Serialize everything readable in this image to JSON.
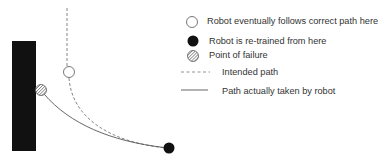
{
  "diagram": {
    "wall": {
      "x": 12,
      "y": 41,
      "w": 24,
      "h": 110,
      "color": "#111111"
    },
    "intended_path": {
      "style": "dashed",
      "color": "#555555",
      "d": "M67 8 L67 66 M69 78 C72 118 110 142 166 148"
    },
    "actual_path": {
      "style": "solid",
      "color": "#444444",
      "d": "M43 94 C70 125 110 140 166 148"
    },
    "markers": {
      "correct_path_point": {
        "cx": 69,
        "cy": 72,
        "r": 5.5,
        "fill": "#ffffff"
      },
      "failure_point": {
        "cx": 41,
        "cy": 90,
        "r": 5.5,
        "fill": "hatched"
      },
      "retrain_point": {
        "cx": 169,
        "cy": 148,
        "r": 5.5,
        "fill": "#111111"
      }
    }
  },
  "legend": {
    "items": [
      {
        "icon": "open-circle",
        "label": "Robot eventually follows correct path here"
      },
      {
        "icon": "filled-circle",
        "label": "Robot is re-trained from here"
      },
      {
        "icon": "hatched-circle",
        "label": "Point of failure"
      },
      {
        "icon": "dashed-line",
        "label": "Intended path"
      },
      {
        "icon": "solid-line",
        "label": "Path actually taken by robot"
      }
    ]
  }
}
